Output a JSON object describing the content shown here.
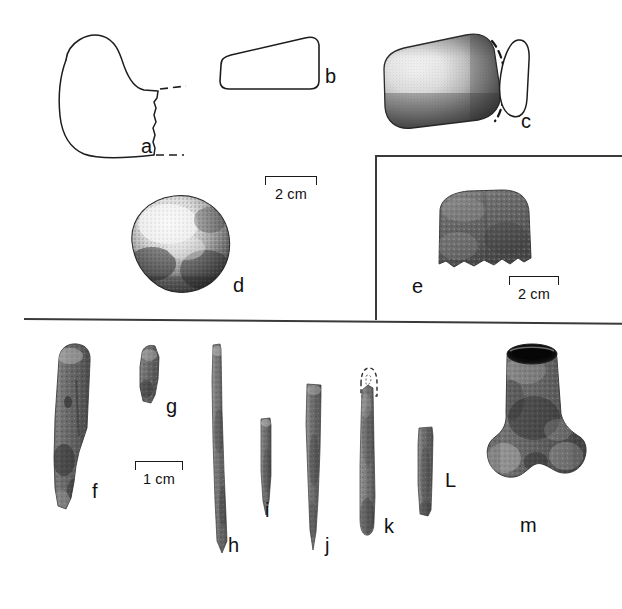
{
  "figure": {
    "background_color": "#ffffff",
    "ink_color": "#111111",
    "width": 622,
    "height": 609
  },
  "panels": [
    {
      "name": "upper-panel",
      "description": "Line drawings and halftone photographs of ground stone artifacts",
      "items": [
        "a",
        "b",
        "c",
        "d"
      ]
    },
    {
      "name": "inset-panel-e",
      "description": "Boxed inset at right containing artifact e with its own scale",
      "items": [
        "e"
      ]
    },
    {
      "name": "lower-panel",
      "description": "Halftone photographs of worked bone tools",
      "items": [
        "f",
        "g",
        "h",
        "i",
        "j",
        "k",
        "L",
        "m"
      ]
    }
  ],
  "artifacts": [
    {
      "id": "a",
      "label": "a",
      "type": "line-drawing",
      "description": "Profile outline of ground stone celt bit fragment with dashed reconstruction lines"
    },
    {
      "id": "b",
      "label": "b",
      "type": "line-drawing",
      "description": "Wedge-shaped cross-section / side profile outline"
    },
    {
      "id": "c",
      "label": "c",
      "type": "stipple-drawing",
      "description": "Stippled ground stone celt with dashed reconstructed edge, plus cross-section outline at right"
    },
    {
      "id": "d",
      "label": "d",
      "type": "photograph",
      "description": "Rounded hammerstone / spheroid"
    },
    {
      "id": "e",
      "label": "e",
      "type": "photograph",
      "description": "Ground stone fragment, boxed inset"
    },
    {
      "id": "f",
      "label": "f",
      "type": "photograph",
      "description": "Split bone shaft fragment / bone tool"
    },
    {
      "id": "g",
      "label": "g",
      "type": "photograph",
      "description": "Small bone splinter fragment"
    },
    {
      "id": "h",
      "label": "h",
      "type": "photograph",
      "description": "Long slender bone awl / needle"
    },
    {
      "id": "i",
      "label": "i",
      "type": "photograph",
      "description": "Short bone awl tip"
    },
    {
      "id": "j",
      "label": "j",
      "type": "photograph",
      "description": "Tapered bone awl"
    },
    {
      "id": "k",
      "label": "k",
      "type": "photograph",
      "description": "Bone point with dashed reconstruction of broken proximal end"
    },
    {
      "id": "L",
      "label": "L",
      "type": "photograph",
      "description": "Rectangular bone blank / strip"
    },
    {
      "id": "m",
      "label": "m",
      "type": "photograph",
      "description": "Perforated / hollowed distal bone, tubular socket"
    }
  ],
  "scales": [
    {
      "id": "scale-upper",
      "label": "2 cm",
      "units": "cm",
      "value": 2,
      "applies_to": [
        "a",
        "b",
        "c",
        "d"
      ]
    },
    {
      "id": "scale-inset",
      "label": "2 cm",
      "units": "cm",
      "value": 2,
      "applies_to": [
        "e"
      ]
    },
    {
      "id": "scale-lower",
      "label": "1 cm",
      "units": "cm",
      "value": 1,
      "applies_to": [
        "f",
        "g",
        "h",
        "i",
        "j",
        "k",
        "L",
        "m"
      ]
    }
  ]
}
